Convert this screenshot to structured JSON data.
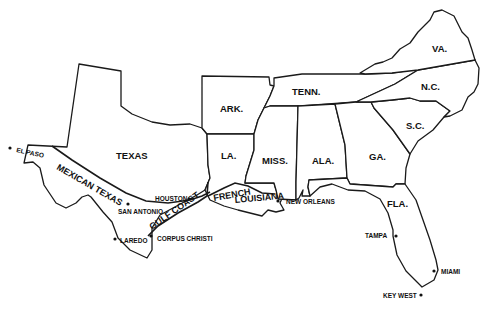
{
  "map": {
    "states": [
      {
        "id": "texas",
        "label": "TEXAS"
      },
      {
        "id": "arkansas",
        "label": "ARK."
      },
      {
        "id": "louisiana",
        "label": "LA."
      },
      {
        "id": "tennessee",
        "label": "TENN."
      },
      {
        "id": "mississippi",
        "label": "MISS."
      },
      {
        "id": "alabama",
        "label": "ALA."
      },
      {
        "id": "georgia",
        "label": "GA."
      },
      {
        "id": "florida",
        "label": "FLA."
      },
      {
        "id": "south-carolina",
        "label": "S.C."
      },
      {
        "id": "north-carolina",
        "label": "N.C."
      },
      {
        "id": "virginia",
        "label": "VA."
      }
    ],
    "regions": [
      {
        "id": "mexican-texas",
        "label": "MEXICAN TEXAS"
      },
      {
        "id": "gulf-coast",
        "label": "GULF COAST"
      },
      {
        "id": "french-louisiana-1",
        "label": "FRENCH"
      },
      {
        "id": "french-louisiana-2",
        "label": "LOUISIANA"
      }
    ],
    "cities": [
      {
        "id": "el-paso",
        "label": "EL PASO"
      },
      {
        "id": "houston",
        "label": "HOUSTON"
      },
      {
        "id": "san-antonio",
        "label": "SAN ANTONIO"
      },
      {
        "id": "laredo",
        "label": "LAREDO"
      },
      {
        "id": "corpus-christi",
        "label": "CORPUS CHRISTI"
      },
      {
        "id": "new-orleans",
        "label": "NEW ORLEANS"
      },
      {
        "id": "tampa",
        "label": "TAMPA"
      },
      {
        "id": "miami",
        "label": "MIAMI"
      },
      {
        "id": "key-west",
        "label": "KEY WEST"
      }
    ]
  }
}
